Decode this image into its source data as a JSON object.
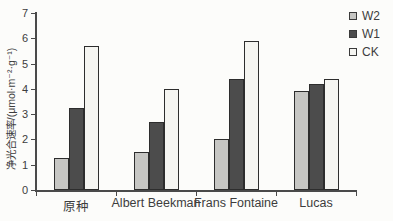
{
  "chart_data": {
    "type": "bar",
    "title": "",
    "categories": [
      "原种",
      "Albert Beekman",
      "Frans Fontaine",
      "Lucas"
    ],
    "series": [
      {
        "name": "W2",
        "color": "#c6c6c3",
        "values": [
          1.25,
          1.5,
          2.0,
          3.9
        ]
      },
      {
        "name": "W1",
        "color": "#4c4c4c",
        "values": [
          3.25,
          2.7,
          4.4,
          4.2
        ]
      },
      {
        "name": "CK",
        "color": "#f5f5f1",
        "values": [
          5.7,
          4.0,
          5.9,
          4.4
        ]
      }
    ],
    "xlabel": "",
    "ylabel": "净光合速率/(μmol·m⁻²·g⁻¹)",
    "ylim": [
      0,
      7
    ],
    "ytick_step": 1,
    "grid": false,
    "legend_position": "top-right",
    "legend_entries": [
      "W2",
      "W1",
      "CK"
    ]
  },
  "colors": {
    "axis": "#4a4a4a",
    "text": "#3d3d3d",
    "bar_border": "#2d2d2d",
    "background": "#fcfcfa"
  }
}
